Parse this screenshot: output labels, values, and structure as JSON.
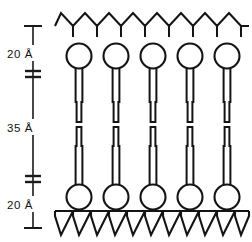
{
  "figure": {
    "background_color": "#ffffff",
    "ink_color": "#141414",
    "width": 252,
    "height": 242
  },
  "measurements": {
    "axis_x": 33,
    "top_cap_y": 26,
    "bottom_cap_y": 228,
    "divider_upper_y": 74,
    "divider_lower_y": 179,
    "items": [
      {
        "id": "upper-leaflet-thickness",
        "value": "20 Å",
        "label_x": 8,
        "label_y": 54,
        "span_top": 26,
        "span_bottom": 74
      },
      {
        "id": "hydrophobic-core-thickness",
        "value": "35 Å",
        "label_x": 8,
        "label_y": 128,
        "span_top": 74,
        "span_bottom": 179
      },
      {
        "id": "lower-leaflet-thickness",
        "value": "20 Å",
        "label_x": 8,
        "label_y": 205,
        "span_top": 179,
        "span_bottom": 228
      }
    ]
  },
  "membrane": {
    "lipid_count": 5,
    "lipid_x_positions": [
      79,
      116,
      153,
      190,
      227
    ],
    "upper_leaflet": {
      "head_center_y": 56,
      "head_radius": 12.5,
      "tail_top_y": 68,
      "tail_bottom_y": 122,
      "tail_half_width": 3.4,
      "tail_narrow_half_width": 2.4,
      "tail_step_y": 104
    },
    "lower_leaflet": {
      "head_center_y": 197,
      "head_radius": 12.5,
      "tail_bottom_y": 185,
      "tail_top_y": 127,
      "tail_half_width": 3.4,
      "tail_narrow_half_width": 2.4,
      "tail_step_y": 146
    }
  },
  "top_layer": {
    "id": "upper-zigzag-chain",
    "baseline_y": 26,
    "peak_y": 13,
    "x_start": 55,
    "x_end": 249,
    "segment_width": 12.1,
    "stem_length": 11,
    "stem_count": 8
  },
  "bottom_layer": {
    "id": "lower-zigzag-chain",
    "rule_y": 211,
    "rule_x_start": 55,
    "rule_x_end": 249,
    "valley_y": 235,
    "segment_width": 12.1,
    "x_start": 55,
    "x_end": 249
  }
}
